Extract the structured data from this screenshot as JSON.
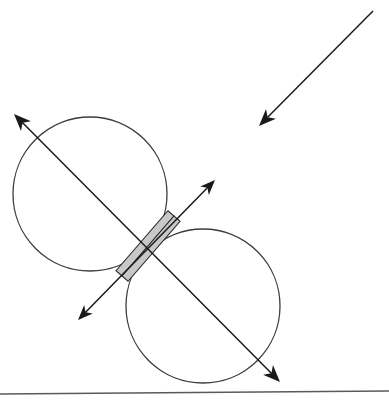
{
  "canvas": {
    "width": 389,
    "height": 400,
    "background": "#ffffff",
    "title": "Two tangent circles with crossed axis arrows and shaded bar"
  },
  "style": {
    "stroke_color": "#1a1a1a",
    "circle_stroke": "#3c3c3c",
    "bar_fill": "#c8c8c8",
    "bar_fill_light": "#e4e4e4",
    "bar_stroke": "#2a2a2a",
    "baseline_color": "#5a5a5a",
    "circle_stroke_width": 1.3,
    "axis_stroke_width": 1.5,
    "bar_stroke_width": 1.1,
    "baseline_stroke_width": 1.6
  },
  "shapes": {
    "circles": [
      {
        "name": "upper-left-circle",
        "cx": 90,
        "cy": 194,
        "r": 77
      },
      {
        "name": "lower-right-circle",
        "cx": 203,
        "cy": 306,
        "r": 77
      }
    ],
    "tangent_point": {
      "x": 147,
      "y": 250
    },
    "main_axis": {
      "name": "main-double-arrow",
      "x1": 14,
      "y1": 114,
      "x2": 280,
      "y2": 382,
      "double_headed": true,
      "head_length": 17,
      "head_width": 7
    },
    "secondary_axis": {
      "name": "secondary-double-arrow",
      "x1": 78,
      "y1": 320,
      "x2": 215,
      "y2": 180,
      "double_headed": true,
      "head_length": 15,
      "head_width": 6
    },
    "incoming_arrow": {
      "name": "incoming-single-arrow",
      "x1": 373,
      "y1": 11,
      "x2": 259,
      "y2": 126,
      "double_headed": false,
      "head_length": 17,
      "head_width": 7
    },
    "shaded_bar": {
      "name": "shaded-bar",
      "x1": 122,
      "y1": 276,
      "x2": 174,
      "y2": 216,
      "half_width": 8,
      "strips": 2
    },
    "baseline": {
      "name": "ground-baseline",
      "x1": 0,
      "y1": 394,
      "x2": 389,
      "y2": 391
    }
  }
}
